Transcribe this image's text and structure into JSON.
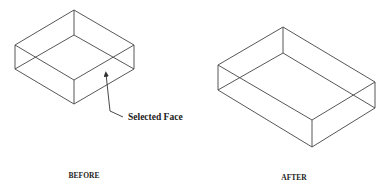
{
  "diagram": {
    "type": "isometric-wireframe-comparison",
    "colors": {
      "line": "#444444",
      "text": "#222222",
      "background": "#ffffff"
    },
    "panels": [
      {
        "id": "before",
        "caption": "BEFORE",
        "box": {
          "top": [
            [
              74,
              10
            ],
            [
              15,
              45
            ],
            [
              74,
              80
            ],
            [
              134,
              45
            ]
          ],
          "bottom": [
            [
              74,
              35
            ],
            [
              15,
              69
            ],
            [
              74,
              104
            ],
            [
              134,
              69
            ]
          ]
        },
        "annotation": {
          "text": "Selected Face",
          "arrow_tip": [
            106,
            74
          ],
          "leader_points": [
            [
              110,
              111
            ],
            [
              123,
              117
            ]
          ]
        }
      },
      {
        "id": "after",
        "caption": "AFTER",
        "box": {
          "top": [
            [
              283,
              27
            ],
            [
              218,
              65
            ],
            [
              312,
              120
            ],
            [
              375,
              82
            ]
          ],
          "bottom": [
            [
              283,
              53
            ],
            [
              218,
              90
            ],
            [
              312,
              147
            ],
            [
              375,
              108
            ]
          ]
        }
      }
    ]
  }
}
